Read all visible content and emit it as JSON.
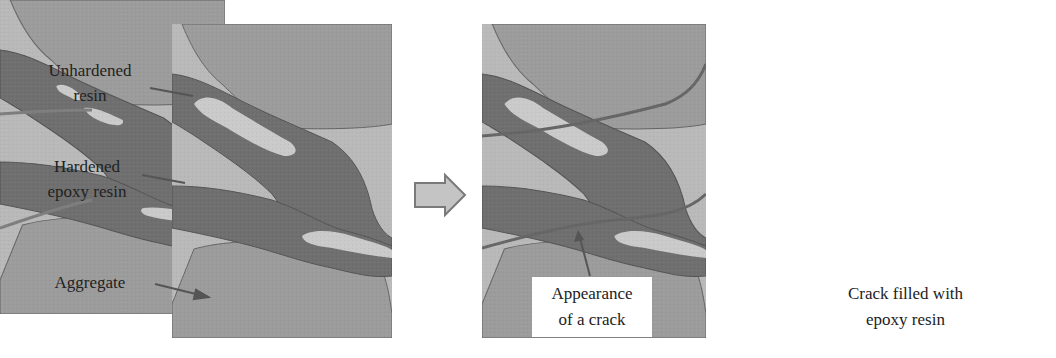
{
  "figure": {
    "panels": [
      {
        "id": "initial",
        "caption": ""
      },
      {
        "id": "crack",
        "caption_lines": [
          "Appearance",
          "of a crack"
        ]
      },
      {
        "id": "filled",
        "caption_lines": [
          "Crack filled with",
          "epoxy resin"
        ]
      }
    ],
    "left_labels": {
      "unhardened": [
        "Unhardened",
        "resin"
      ],
      "hardened": [
        "Hardened",
        "epoxy resin"
      ],
      "aggregate": "Aggregate"
    },
    "colors": {
      "aggregate": "#9c9c9c",
      "matrix": "#b9b9b9",
      "hardened_resin": "#6f6f6f",
      "unhardened_resin": "#cacaca",
      "crack": "#666666",
      "arrow_fill": "#c4c4c4",
      "arrow_stroke": "#7a7a7a"
    },
    "transition_arrows": 2
  }
}
